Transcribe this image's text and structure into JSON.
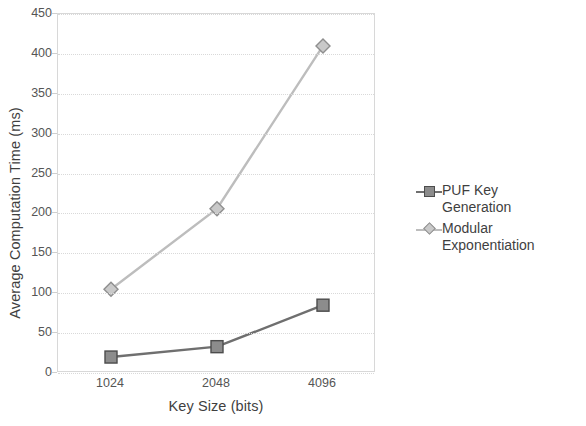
{
  "chart_data": {
    "type": "line",
    "title": "",
    "xlabel": "Key Size (bits)",
    "ylabel": "Average Computation Time (ms)",
    "categories": [
      "1024",
      "2048",
      "4096"
    ],
    "ylim": [
      0,
      450
    ],
    "yticks": [
      0,
      50,
      100,
      150,
      200,
      250,
      300,
      350,
      400,
      450
    ],
    "ytick_labels": [
      "0",
      "50",
      "100",
      "150",
      "200",
      "250",
      "300",
      "350",
      "400",
      "450"
    ],
    "grid": true,
    "legend_position": "right",
    "series": [
      {
        "name": "PUF Key\nGeneration",
        "legend_label": "PUF Key\nGeneration",
        "marker": "square",
        "color": "#6f6f6f",
        "marker_fill": "#8c8c8c",
        "marker_edge": "#4c4c4c",
        "values": [
          20,
          33,
          85
        ]
      },
      {
        "name": "Modular\nExponentiation",
        "legend_label": "Modular\nExponentiation",
        "marker": "diamond",
        "color": "#bdbdbd",
        "marker_fill": "#c9c9c9",
        "marker_edge": "#8e8e8e",
        "values": [
          105,
          206,
          410
        ]
      }
    ]
  }
}
